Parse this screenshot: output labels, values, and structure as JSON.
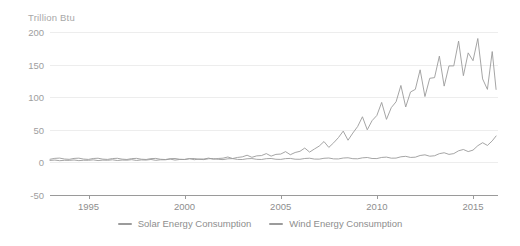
{
  "chart_data": {
    "type": "line",
    "title": "",
    "subtitle": "",
    "ylabel": "Trillion Btu",
    "xlabel": "",
    "ylim": [
      -50,
      200
    ],
    "xlim": [
      1993.0,
      2016.3
    ],
    "grid": true,
    "legend_position": "bottom-center",
    "y_ticks": [
      200,
      150,
      100,
      50,
      0,
      -50
    ],
    "y_tick_labels": [
      "200",
      "150",
      "100",
      "50",
      "0",
      "-50"
    ],
    "x_ticks": [
      1995,
      2000,
      2005,
      2010,
      2015
    ],
    "x_tick_labels": [
      "1995",
      "2000",
      "2005",
      "2010",
      "2015"
    ],
    "colors": {
      "solar": "#9b9b9b",
      "wind": "#9b9b9b",
      "gridline": "#ededed",
      "axis": "#9a9a9a",
      "tick_text": "#9a9a9a",
      "axis_title_text": "#a8a8a8"
    },
    "series": [
      {
        "name": "Solar Energy Consumption",
        "color": "#9b9b9b",
        "x": [
          1993.0,
          1993.25,
          1993.5,
          1993.75,
          1994.0,
          1994.25,
          1994.5,
          1994.75,
          1995.0,
          1995.25,
          1995.5,
          1995.75,
          1996.0,
          1996.25,
          1996.5,
          1996.75,
          1997.0,
          1997.25,
          1997.5,
          1997.75,
          1998.0,
          1998.25,
          1998.5,
          1998.75,
          1999.0,
          1999.25,
          1999.5,
          1999.75,
          2000.0,
          2000.25,
          2000.5,
          2000.75,
          2001.0,
          2001.25,
          2001.5,
          2001.75,
          2002.0,
          2002.25,
          2002.5,
          2002.75,
          2003.0,
          2003.25,
          2003.5,
          2003.75,
          2004.0,
          2004.25,
          2004.5,
          2004.75,
          2005.0,
          2005.25,
          2005.5,
          2005.75,
          2006.0,
          2006.25,
          2006.5,
          2006.75,
          2007.0,
          2007.25,
          2007.5,
          2007.75,
          2008.0,
          2008.25,
          2008.5,
          2008.75,
          2009.0,
          2009.25,
          2009.5,
          2009.75,
          2010.0,
          2010.25,
          2010.5,
          2010.75,
          2011.0,
          2011.25,
          2011.5,
          2011.75,
          2012.0,
          2012.25,
          2012.5,
          2012.75,
          2013.0,
          2013.25,
          2013.5,
          2013.75,
          2014.0,
          2014.25,
          2014.5,
          2014.75,
          2015.0,
          2015.25,
          2015.5,
          2015.75,
          2016.0,
          2016.2
        ],
        "values": [
          4.8,
          6.2,
          6.6,
          5.2,
          4.7,
          6.1,
          6.5,
          5.1,
          4.6,
          6.0,
          6.4,
          5.0,
          4.6,
          5.9,
          6.3,
          5.0,
          4.5,
          5.8,
          6.2,
          4.9,
          4.5,
          5.8,
          6.1,
          4.8,
          4.4,
          5.7,
          6.0,
          4.8,
          4.4,
          5.6,
          6.0,
          4.7,
          4.3,
          5.6,
          5.9,
          4.7,
          4.3,
          5.5,
          5.8,
          4.6,
          4.4,
          5.6,
          5.9,
          4.7,
          4.5,
          5.7,
          6.0,
          4.8,
          4.6,
          5.8,
          6.1,
          4.9,
          4.8,
          6.0,
          6.4,
          5.1,
          5.0,
          6.3,
          6.7,
          5.4,
          5.3,
          6.7,
          7.1,
          5.7,
          5.5,
          7.0,
          7.5,
          6.0,
          5.9,
          7.6,
          8.1,
          6.5,
          6.6,
          8.6,
          9.3,
          7.6,
          8.0,
          10.6,
          11.6,
          9.5,
          10.2,
          13.4,
          14.8,
          12.3,
          13.5,
          17.8,
          19.8,
          16.6,
          18.8,
          25.6,
          30.2,
          26.0,
          33.0,
          40.5
        ]
      },
      {
        "name": "Wind Energy Consumption",
        "color": "#9b9b9b",
        "x": [
          1993.0,
          1993.25,
          1993.5,
          1993.75,
          1994.0,
          1994.25,
          1994.5,
          1994.75,
          1995.0,
          1995.25,
          1995.5,
          1995.75,
          1996.0,
          1996.25,
          1996.5,
          1996.75,
          1997.0,
          1997.25,
          1997.5,
          1997.75,
          1998.0,
          1998.25,
          1998.5,
          1998.75,
          1999.0,
          1999.25,
          1999.5,
          1999.75,
          2000.0,
          2000.25,
          2000.5,
          2000.75,
          2001.0,
          2001.25,
          2001.5,
          2001.75,
          2002.0,
          2002.25,
          2002.5,
          2002.75,
          2003.0,
          2003.25,
          2003.5,
          2003.75,
          2004.0,
          2004.25,
          2004.5,
          2004.75,
          2005.0,
          2005.25,
          2005.5,
          2005.75,
          2006.0,
          2006.25,
          2006.5,
          2006.75,
          2007.0,
          2007.25,
          2007.5,
          2007.75,
          2008.0,
          2008.25,
          2008.5,
          2008.75,
          2009.0,
          2009.25,
          2009.5,
          2009.75,
          2010.0,
          2010.25,
          2010.5,
          2010.75,
          2011.0,
          2011.25,
          2011.5,
          2011.75,
          2012.0,
          2012.25,
          2012.5,
          2012.75,
          2013.0,
          2013.25,
          2013.5,
          2013.75,
          2014.0,
          2014.25,
          2014.5,
          2014.75,
          2015.0,
          2015.25,
          2015.5,
          2015.75,
          2016.0,
          2016.2
        ],
        "values": [
          3.0,
          3.6,
          2.6,
          3.2,
          3.1,
          3.7,
          2.7,
          3.3,
          3.2,
          3.9,
          2.8,
          3.5,
          3.3,
          4.0,
          2.9,
          3.6,
          3.4,
          4.2,
          3.0,
          3.8,
          3.6,
          4.5,
          3.2,
          4.0,
          4.0,
          5.0,
          3.6,
          4.5,
          4.6,
          5.8,
          4.1,
          5.2,
          5.2,
          6.6,
          4.7,
          6.0,
          6.5,
          8.3,
          5.9,
          7.6,
          8.5,
          11.0,
          7.8,
          10.0,
          10.5,
          13.5,
          9.6,
          12.3,
          12.8,
          16.5,
          11.8,
          15.2,
          17.0,
          22.0,
          15.8,
          20.5,
          25.0,
          32.0,
          23.0,
          30.0,
          38.0,
          48.0,
          34.0,
          45.0,
          55.0,
          70.0,
          50.0,
          64.0,
          72.0,
          92.0,
          66.0,
          84.0,
          93.0,
          118.0,
          85.0,
          108.0,
          112.0,
          142.0,
          101.0,
          129.0,
          130.0,
          163.0,
          117.0,
          148.0,
          148.0,
          186.0,
          133.0,
          168.0,
          156.0,
          190.0,
          128.0,
          112.0,
          170.0,
          112.0
        ]
      }
    ]
  },
  "legend": {
    "items": [
      {
        "label": "Solar Energy Consumption",
        "color": "#9b9b9b"
      },
      {
        "label": "Wind Energy Consumption",
        "color": "#9b9b9b"
      }
    ]
  }
}
